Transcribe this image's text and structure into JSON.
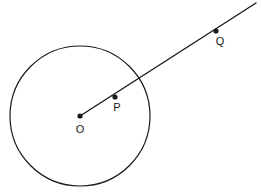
{
  "figure": {
    "background_color": "#ffffff",
    "stroke_color": "#1a1a1a",
    "label_color": "#1a1a1a",
    "width": 261,
    "height": 196
  },
  "circle": {
    "name": "circle-O",
    "center_x": 80,
    "center_y": 116,
    "radius": 70,
    "stroke_width": 1.2,
    "fill": "none"
  },
  "ray": {
    "name": "ray-OQ",
    "start_x": 80,
    "start_y": 116,
    "end_x": 256,
    "end_y": 3,
    "stroke_width": 1.4
  },
  "points": [
    {
      "id": "O",
      "label": "O",
      "x": 80,
      "y": 116,
      "dot_radius": 2.6,
      "label_x": 80,
      "label_y": 133,
      "label_anchor": "middle",
      "role": "center-of-circle"
    },
    {
      "id": "P",
      "label": "P",
      "x": 115,
      "y": 97,
      "dot_radius": 2.6,
      "label_x": 117,
      "label_y": 111,
      "label_anchor": "middle",
      "role": "point-inside-circle"
    },
    {
      "id": "Q",
      "label": "Q",
      "x": 216,
      "y": 31,
      "dot_radius": 2.6,
      "label_x": 220,
      "label_y": 45,
      "label_anchor": "middle",
      "role": "point-outside-circle"
    }
  ]
}
